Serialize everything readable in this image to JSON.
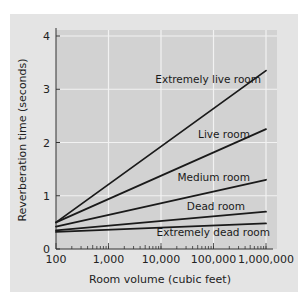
{
  "chart_data": {
    "type": "line",
    "title": "",
    "xlabel": "Room volume (cubic feet)",
    "ylabel": "Reverberation time (seconds)",
    "x_scale": "log",
    "x": [
      100,
      1000000
    ],
    "x_ticks": [
      "100",
      "1,000",
      "10,000",
      "100,000",
      "1,000,000"
    ],
    "y_ticks": [
      "0",
      "1",
      "2",
      "3",
      "4"
    ],
    "ylim": [
      0,
      4
    ],
    "xlim": [
      100,
      1000000
    ],
    "grid": true,
    "legend": "inline labels",
    "series": [
      {
        "name": "Extremely live room",
        "values": [
          0.5,
          3.35
        ]
      },
      {
        "name": "Live room",
        "values": [
          0.5,
          2.25
        ]
      },
      {
        "name": "Medium room",
        "values": [
          0.42,
          1.3
        ]
      },
      {
        "name": "Dead room",
        "values": [
          0.35,
          0.7
        ]
      },
      {
        "name": "Extremely dead room",
        "values": [
          0.32,
          0.48
        ]
      }
    ]
  },
  "colors": {
    "panel": "#e4e4e4",
    "plot_area": "#d2d2d2",
    "grid": "#f2f2f2",
    "line": "#1a1a1a"
  }
}
